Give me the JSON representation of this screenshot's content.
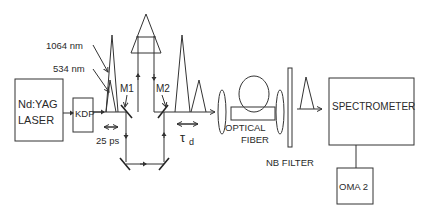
{
  "diagram": {
    "labels": {
      "wavelength_1064": "1064 nm",
      "wavelength_534": "534 nm",
      "laser_line1": "Nd:YAG",
      "laser_line2": "LASER",
      "kdp": "KDP",
      "mirror1": "M1",
      "mirror2": "M2",
      "pulse_width": "25 ps",
      "delay_symbol": "τ",
      "delay_subscript": "d",
      "fiber_line1": "OPTICAL",
      "fiber_line2": "FIBER",
      "filter": "NB FILTER",
      "spectrometer": "SPECTROMETER",
      "detector": "OMA 2"
    },
    "colors": {
      "line": "#333333",
      "text": "#2a2a2a",
      "background": "#ffffff"
    }
  }
}
